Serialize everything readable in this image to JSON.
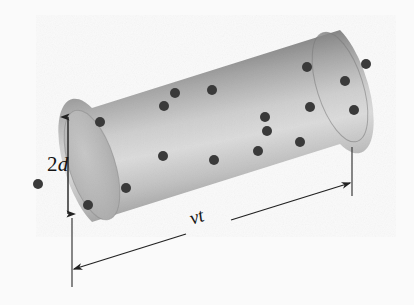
{
  "figure": {
    "kind": "physics-diagram",
    "width": 414,
    "height": 305,
    "background_color": "#fafafa"
  },
  "labels": {
    "diameter": {
      "name": "2d",
      "prefix": "2",
      "symbol": "d",
      "meaning": "cylinder diameter"
    },
    "length": {
      "name": "vt",
      "symbol_v": "v",
      "symbol_t": "t",
      "meaning": "cylinder length"
    }
  },
  "chart_data": {
    "type": "diagram",
    "title": "",
    "cylinder": {
      "axis_angle_deg": -17.5,
      "left_cap_center": [
        92,
        165
      ],
      "right_cap_center": [
        340,
        87
      ],
      "radius_px": 57,
      "cap_ellipse_rx": 23,
      "cap_ellipse_ry": 57,
      "body_fill_top": "#6f6f6f",
      "body_fill_mid": "#d8d8d8",
      "body_fill_bottom": "#9a9a9a",
      "left_cap_fill": "#b4b4b4",
      "right_cap_fill": "#8c8c8c"
    },
    "dots": {
      "count": 18,
      "color": "#3a3a3a",
      "radius_px": 5,
      "points": [
        [
          38,
          184
        ],
        [
          88,
          205
        ],
        [
          100,
          122
        ],
        [
          126,
          188
        ],
        [
          163,
          156
        ],
        [
          164,
          106
        ],
        [
          175,
          93
        ],
        [
          212,
          90
        ],
        [
          214,
          160
        ],
        [
          258,
          151
        ],
        [
          265,
          117
        ],
        [
          267,
          131
        ],
        [
          300,
          142
        ],
        [
          307,
          67
        ],
        [
          310,
          107
        ],
        [
          345,
          81
        ],
        [
          354,
          110
        ],
        [
          366,
          64
        ]
      ]
    },
    "dimensions": [
      {
        "label": "2d",
        "orientation": "vertical",
        "arrowheads": "both",
        "x": 68,
        "y_top": 117,
        "y_bottom": 214,
        "label_pos": [
          47,
          154
        ]
      },
      {
        "label": "vt",
        "orientation": "slanted",
        "arrowheads": "both",
        "from": [
          72,
          270
        ],
        "to": [
          352,
          182
        ],
        "label_pos": [
          190,
          209
        ],
        "extension_lines": [
          {
            "x": 72,
            "y_top": 218,
            "y_bottom": 287
          },
          {
            "x": 352,
            "y_top": 147,
            "y_bottom": 196
          }
        ]
      }
    ],
    "line_color": "#2b2b2b",
    "axis_range_note": "no numeric axes; schematic diagram"
  }
}
